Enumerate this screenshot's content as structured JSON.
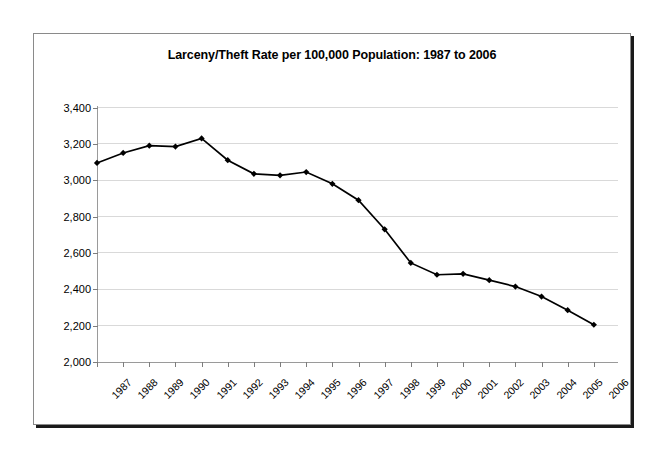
{
  "chart_data": {
    "type": "line",
    "title": "Larceny/Theft Rate per 100,000 Population: 1987 to 2006",
    "xlabel": "",
    "ylabel": "",
    "categories": [
      "1987",
      "1988",
      "1989",
      "1990",
      "1991",
      "1992",
      "1993",
      "1994",
      "1995",
      "1996",
      "1997",
      "1998",
      "1999",
      "2000",
      "2001",
      "2002",
      "2003",
      "2004",
      "2005",
      "2006"
    ],
    "values": [
      3095,
      3150,
      3190,
      3185,
      3230,
      3110,
      3035,
      3027,
      3045,
      2980,
      2890,
      2730,
      2545,
      2480,
      2485,
      2450,
      2415,
      2360,
      2285,
      2205
    ],
    "ylim": [
      2000,
      3400
    ],
    "ytick_values": [
      3400,
      3200,
      3000,
      2800,
      2600,
      2400,
      2200,
      2000
    ],
    "ytick_labels": [
      "3,400",
      "3,200",
      "3,000",
      "2,800",
      "2,600",
      "2,400",
      "2,200",
      "2,000"
    ],
    "grid": true,
    "legend": false,
    "legend_position": "none",
    "series": [
      {
        "name": "Larceny/Theft Rate",
        "line_color": "#000000",
        "marker": "diamond",
        "marker_color": "#000000",
        "values": [
          3095,
          3150,
          3190,
          3185,
          3230,
          3110,
          3035,
          3027,
          3045,
          2980,
          2890,
          2730,
          2545,
          2480,
          2485,
          2450,
          2415,
          2360,
          2285,
          2205
        ]
      }
    ]
  },
  "style": {
    "background": "#ffffff",
    "grid_color": "#d9d9d9",
    "axis_color": "#9a9a9a",
    "frame_border": "#8a8a8a",
    "shadow_color": "#1a1a1a",
    "text_color": "#000000"
  }
}
